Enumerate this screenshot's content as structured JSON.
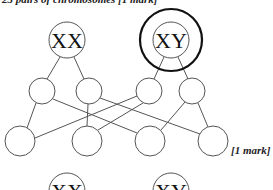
{
  "header": {
    "text": "23 pairs of chromosomes [1 mark]"
  },
  "diagram": {
    "parents": [
      {
        "id": "mother",
        "label": "XX",
        "cx": 67,
        "cy": 40,
        "r": 18
      },
      {
        "id": "father",
        "label": "XY",
        "cx": 171,
        "cy": 40,
        "r": 18,
        "highlight_r": 31
      }
    ],
    "gametes": [
      {
        "id": "g1",
        "label": "",
        "cx": 42,
        "cy": 91,
        "r": 13
      },
      {
        "id": "g2",
        "label": "",
        "cx": 89,
        "cy": 91,
        "r": 13
      },
      {
        "id": "g3",
        "label": "",
        "cx": 149,
        "cy": 91,
        "r": 13
      },
      {
        "id": "g4",
        "label": "",
        "cx": 192,
        "cy": 91,
        "r": 13
      }
    ],
    "offspring": [
      {
        "id": "o1",
        "label": "",
        "cx": 20,
        "cy": 141,
        "r": 15
      },
      {
        "id": "o2",
        "label": "",
        "cx": 87,
        "cy": 141,
        "r": 15
      },
      {
        "id": "o3",
        "label": "",
        "cx": 150,
        "cy": 141,
        "r": 15
      },
      {
        "id": "o4",
        "label": "",
        "cx": 213,
        "cy": 141,
        "r": 15
      }
    ],
    "next_row": [
      {
        "id": "n1",
        "label": "XX",
        "cx": 67,
        "cy": 191,
        "r": 18
      },
      {
        "id": "n2",
        "label": "XY",
        "cx": 171,
        "cy": 191,
        "r": 18
      }
    ]
  },
  "mark": {
    "text": "[1 mark]"
  }
}
